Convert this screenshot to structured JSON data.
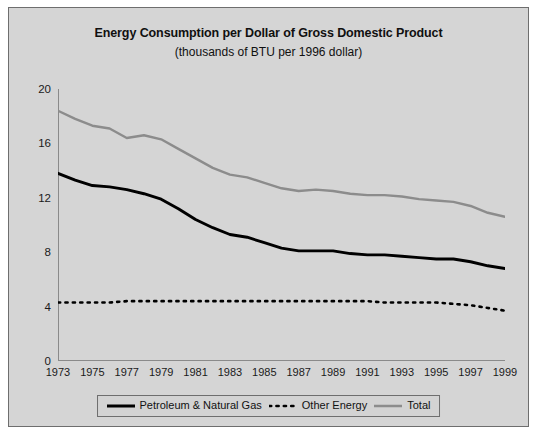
{
  "chart_data": {
    "type": "line",
    "title": "Energy Consumption per Dollar of Gross Domestic Product",
    "subtitle": "(thousands of BTU per 1996 dollar)",
    "xlabel": "",
    "ylabel": "",
    "grid": false,
    "legend_position": "bottom",
    "ylim": [
      0,
      20
    ],
    "yticks": [
      0,
      4,
      8,
      12,
      16,
      20
    ],
    "xlim": [
      1973,
      1999
    ],
    "xticks": [
      1973,
      1975,
      1977,
      1979,
      1981,
      1983,
      1985,
      1987,
      1989,
      1991,
      1993,
      1995,
      1997,
      1999
    ],
    "x": [
      1973,
      1974,
      1975,
      1976,
      1977,
      1978,
      1979,
      1980,
      1981,
      1982,
      1983,
      1984,
      1985,
      1986,
      1987,
      1988,
      1989,
      1990,
      1991,
      1992,
      1993,
      1994,
      1995,
      1996,
      1997,
      1998,
      1999
    ],
    "series": [
      {
        "name": "Petroleum & Natural Gas",
        "style": "solid-black",
        "color": "#000000",
        "values": [
          13.8,
          13.3,
          12.9,
          12.8,
          12.6,
          12.3,
          11.9,
          11.2,
          10.4,
          9.8,
          9.3,
          9.1,
          8.7,
          8.3,
          8.1,
          8.1,
          8.1,
          7.9,
          7.8,
          7.8,
          7.7,
          7.6,
          7.5,
          7.5,
          7.3,
          7.0,
          6.8
        ]
      },
      {
        "name": "Other Energy",
        "style": "dotted-black",
        "color": "#000000",
        "values": [
          4.3,
          4.3,
          4.3,
          4.3,
          4.4,
          4.4,
          4.4,
          4.4,
          4.4,
          4.4,
          4.4,
          4.4,
          4.4,
          4.4,
          4.4,
          4.4,
          4.4,
          4.4,
          4.4,
          4.3,
          4.3,
          4.3,
          4.3,
          4.2,
          4.1,
          3.9,
          3.7
        ]
      },
      {
        "name": "Total",
        "style": "solid-gray",
        "color": "#8c8c8c",
        "values": [
          18.4,
          17.8,
          17.3,
          17.1,
          16.4,
          16.6,
          16.3,
          15.6,
          14.9,
          14.2,
          13.7,
          13.5,
          13.1,
          12.7,
          12.5,
          12.6,
          12.5,
          12.3,
          12.2,
          12.2,
          12.1,
          11.9,
          11.8,
          11.7,
          11.4,
          10.9,
          10.6
        ]
      }
    ]
  },
  "legend": {
    "entries": [
      {
        "label": "Petroleum & Natural Gas",
        "style": "solid-black"
      },
      {
        "label": "Other Energy",
        "style": "dotted-black"
      },
      {
        "label": "Total",
        "style": "solid-gray"
      }
    ]
  },
  "colors": {
    "figure_background": "#d5d5d5",
    "figure_border": "#6e6e6e",
    "axis": "#8a8a8a",
    "total_series": "#8c8c8c",
    "petroleum_series": "#000000",
    "other_series": "#000000"
  }
}
